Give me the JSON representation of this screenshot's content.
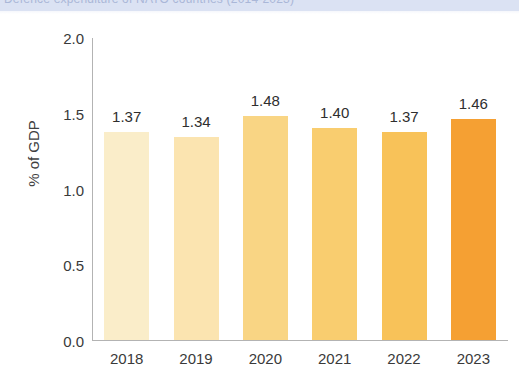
{
  "title_strip": {
    "text": "Defence expenditure of NATO countries (2014-2023)"
  },
  "chart_data": {
    "type": "bar",
    "title": "",
    "subtitle": "",
    "xlabel": "",
    "ylabel": "% of GDP",
    "categories": [
      "2018",
      "2019",
      "2020",
      "2021",
      "2022",
      "2023"
    ],
    "values": [
      1.37,
      1.34,
      1.48,
      1.4,
      1.37,
      1.46
    ],
    "value_labels": [
      "1.37",
      "1.34",
      "1.48",
      "1.40",
      "1.37",
      "1.46"
    ],
    "ylim": [
      0.0,
      2.0
    ],
    "yticks": [
      0.0,
      0.5,
      1.0,
      1.5,
      2.0
    ],
    "ytick_labels": [
      "0.0",
      "0.5",
      "1.0",
      "1.5",
      "2.0"
    ],
    "gridlines": [
      0.5,
      1.0,
      1.5
    ],
    "grid": true,
    "grid_color": "#ffffff",
    "legend": "none",
    "bar_colors": [
      "#faedc9",
      "#fbe4b0",
      "#f9d584",
      "#f9cd6f",
      "#f8c259",
      "#f5a033"
    ],
    "axis_color": "#b3b3b3",
    "text_color": "#3a3a3a",
    "strip_color": "#dbe2f3"
  }
}
